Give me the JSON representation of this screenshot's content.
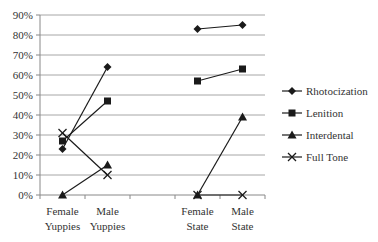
{
  "chart_data": {
    "type": "line",
    "title": "",
    "xlabel": "",
    "ylabel": "",
    "ylim": [
      0,
      90
    ],
    "y_ticks": [
      "0%",
      "10%",
      "20%",
      "30%",
      "40%",
      "50%",
      "60%",
      "70%",
      "80%",
      "90%"
    ],
    "grid": true,
    "legend_position": "right",
    "categories": [
      "Female Yuppies",
      "Male Yuppies",
      "",
      "Female State",
      "Male State"
    ],
    "category_label_lines": [
      [
        "Female",
        "Yuppies"
      ],
      [
        "Male",
        "Yuppies"
      ],
      [
        "",
        ""
      ],
      [
        "Female",
        "State"
      ],
      [
        "Male",
        "State"
      ]
    ],
    "series": [
      {
        "name": "Rhotocization",
        "marker": "diamond",
        "values": [
          23,
          64,
          null,
          83,
          85
        ]
      },
      {
        "name": "Lenition",
        "marker": "square",
        "values": [
          27,
          47,
          null,
          57,
          63
        ]
      },
      {
        "name": "Interdental",
        "marker": "triangle",
        "values": [
          0,
          15,
          null,
          0,
          39
        ]
      },
      {
        "name": "Full Tone",
        "marker": "x",
        "values": [
          31,
          10,
          null,
          0,
          0
        ]
      }
    ],
    "colors": {
      "line": "#1a1a1a",
      "grid": "#a6a6a6",
      "axis": "#888888"
    }
  }
}
